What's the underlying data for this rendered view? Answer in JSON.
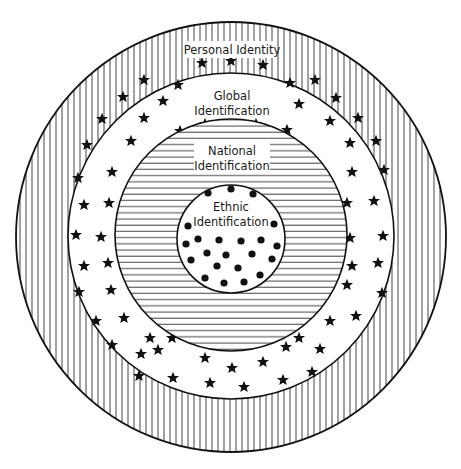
{
  "diagram": {
    "type": "concentric-circles",
    "layers": [
      {
        "id": "personal",
        "label": "Personal Identity",
        "pattern": "vertical-stripes",
        "cx": 231,
        "cy": 237,
        "r": 215
      },
      {
        "id": "global",
        "label_line1": "Global",
        "label_line2": "Identification",
        "pattern": "stars",
        "cx": 231,
        "cy": 236,
        "r": 163
      },
      {
        "id": "national",
        "label_line1": "National",
        "label_line2": "Identification",
        "pattern": "horizontal-stripes",
        "cx": 231,
        "cy": 235,
        "r": 116
      },
      {
        "id": "ethnic",
        "label_line1": "Ethnic",
        "label_line2": "Identification",
        "pattern": "dots",
        "cx": 231,
        "cy": 239,
        "r": 54
      }
    ],
    "colors": {
      "ink": "#1a1a1a",
      "background": "#ffffff",
      "stripe": "#555555"
    }
  }
}
